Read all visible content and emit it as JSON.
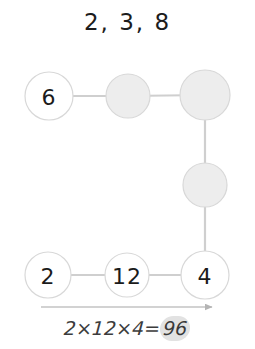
{
  "title": "2, 3, 8",
  "colors": {
    "background": "#ffffff",
    "node_fill_empty": "#ededed",
    "node_fill_filled": "#ffffff",
    "node_stroke": "#d8d8d8",
    "edge": "#cfcfcf",
    "text": "#1b1b1b",
    "equation_text": "#3c3c3c",
    "result_highlight": "#e2e2e2"
  },
  "graph": {
    "nodes": [
      {
        "id": "n-6",
        "label": "6",
        "state": "filled",
        "cx": 49,
        "cy": 96,
        "r": 24
      },
      {
        "id": "n-t2",
        "label": "",
        "state": "empty",
        "cx": 128,
        "cy": 96,
        "r": 22
      },
      {
        "id": "n-t3",
        "label": "",
        "state": "empty",
        "cx": 205,
        "cy": 95,
        "r": 25
      },
      {
        "id": "n-m1",
        "label": "",
        "state": "empty",
        "cx": 205,
        "cy": 185,
        "r": 22
      },
      {
        "id": "n-2",
        "label": "2",
        "state": "filled",
        "cx": 48,
        "cy": 275,
        "r": 23
      },
      {
        "id": "n-12",
        "label": "12",
        "state": "filled",
        "cx": 127,
        "cy": 275,
        "r": 22
      },
      {
        "id": "n-4",
        "label": "4",
        "state": "filled",
        "cx": 205,
        "cy": 275,
        "r": 24
      }
    ],
    "edges": [
      {
        "id": "e-6-t2",
        "from": "n-6",
        "to": "n-t2"
      },
      {
        "id": "e-t2-t3",
        "from": "n-t2",
        "to": "n-t3"
      },
      {
        "id": "e-t3-m1",
        "from": "n-t3",
        "to": "n-m1"
      },
      {
        "id": "e-m1-4",
        "from": "n-m1",
        "to": "n-4"
      },
      {
        "id": "e-2-12",
        "from": "n-2",
        "to": "n-12"
      },
      {
        "id": "e-12-4",
        "from": "n-12",
        "to": "n-4"
      }
    ]
  },
  "equation": {
    "expression": "2×12×4=",
    "result": "96",
    "full": "2×12×4=96",
    "arrow": {
      "label": "progress-arrow",
      "x1": 41,
      "x2": 212,
      "y": 307
    }
  }
}
